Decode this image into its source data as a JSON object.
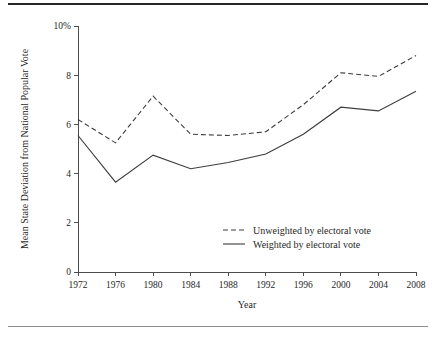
{
  "figure": {
    "top_rule_color": "#262626",
    "bottom_rule_color": "#8c8c8c",
    "background": "#ffffff",
    "line_color": "#3c3c3c",
    "axis_color": "#4d4d4d"
  },
  "chart_data": {
    "type": "line",
    "title": "",
    "xlabel": "Year",
    "ylabel": "Mean State Deviation from National Popular Vote",
    "categories": [
      1972,
      1976,
      1980,
      1984,
      1988,
      1992,
      1996,
      2000,
      2004,
      2008
    ],
    "x_tick_labels": [
      "1972",
      "1976",
      "1980",
      "1984",
      "1988",
      "1992",
      "1996",
      "2000",
      "2004",
      "2008"
    ],
    "y_tick_values": [
      0,
      2,
      4,
      6,
      8,
      10
    ],
    "y_tick_labels": [
      "0",
      "2",
      "4",
      "6",
      "8",
      "10%"
    ],
    "ylim": [
      0,
      10
    ],
    "xlim": [
      1972,
      2008
    ],
    "grid": false,
    "legend_position": "inside-lower-right",
    "series": [
      {
        "name": "Unweighted by electoral vote",
        "style": "dashed",
        "values": [
          6.2,
          5.25,
          7.15,
          5.6,
          5.55,
          5.7,
          6.8,
          8.1,
          7.95,
          8.8
        ]
      },
      {
        "name": "Weighted by electoral vote",
        "style": "solid",
        "values": [
          5.55,
          3.65,
          4.75,
          4.2,
          4.45,
          4.8,
          5.6,
          6.7,
          6.55,
          7.35
        ]
      }
    ]
  },
  "legend": {
    "entries": [
      {
        "label": "Unweighted by electoral vote",
        "style": "dashed"
      },
      {
        "label": "Weighted by electoral vote",
        "style": "solid"
      }
    ]
  },
  "caption": {
    "text": ""
  }
}
